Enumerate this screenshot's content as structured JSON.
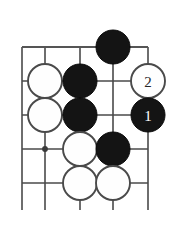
{
  "figure": {
    "name": "go-board-diagram",
    "type": "go-diagram",
    "width": 175,
    "height": 232,
    "background_color": "#ffffff",
    "line_color": "#4a4a4a",
    "black_stone_color": "#141414",
    "white_stone_color": "#fefefe",
    "white_stone_outline_color": "#4a4a4a"
  },
  "board": {
    "stone_radius": 17,
    "columns_x": [
      22,
      45,
      80,
      113,
      148
    ],
    "rows_y": [
      47,
      81,
      115,
      149,
      183
    ],
    "vertical_lines": [
      {
        "x": 22,
        "y1": 47,
        "y2": 210
      },
      {
        "x": 45,
        "y1": 47,
        "y2": 210
      },
      {
        "x": 80,
        "y1": 47,
        "y2": 210
      },
      {
        "x": 113,
        "y1": 47,
        "y2": 210
      },
      {
        "x": 148,
        "y1": 47,
        "y2": 210
      }
    ],
    "horizontal_lines": [
      {
        "y": 47,
        "x1": 22,
        "x2": 148,
        "emphasis": true
      },
      {
        "y": 81,
        "x1": 22,
        "x2": 148,
        "emphasis": false
      },
      {
        "y": 115,
        "x1": 22,
        "x2": 148,
        "emphasis": false
      },
      {
        "y": 149,
        "x1": 22,
        "x2": 148,
        "emphasis": false
      },
      {
        "y": 183,
        "x1": 22,
        "x2": 148,
        "emphasis": false
      }
    ],
    "star_points": [
      {
        "x": 45,
        "y": 149
      }
    ]
  },
  "stones": [
    {
      "id": "stone-black-c4r1",
      "color": "black",
      "x": 113,
      "y": 47,
      "label": ""
    },
    {
      "id": "stone-white-c2r2",
      "color": "white",
      "x": 45,
      "y": 81,
      "label": ""
    },
    {
      "id": "stone-black-c3r2",
      "color": "black",
      "x": 80,
      "y": 81,
      "label": ""
    },
    {
      "id": "stone-white-c5r2",
      "color": "white",
      "x": 148,
      "y": 81,
      "label": "2"
    },
    {
      "id": "stone-white-c2r3",
      "color": "white",
      "x": 45,
      "y": 115,
      "label": ""
    },
    {
      "id": "stone-black-c3r3",
      "color": "black",
      "x": 80,
      "y": 115,
      "label": ""
    },
    {
      "id": "stone-black-c5r3",
      "color": "black",
      "x": 148,
      "y": 115,
      "label": "1"
    },
    {
      "id": "stone-white-c3r4",
      "color": "white",
      "x": 80,
      "y": 149,
      "label": ""
    },
    {
      "id": "stone-black-c4r4",
      "color": "black",
      "x": 113,
      "y": 149,
      "label": ""
    },
    {
      "id": "stone-white-c3r5",
      "color": "white",
      "x": 80,
      "y": 183,
      "label": ""
    },
    {
      "id": "stone-white-c4r5",
      "color": "white",
      "x": 113,
      "y": 183,
      "label": ""
    }
  ],
  "move_labels": {
    "move_1": "1",
    "move_2": "2"
  },
  "caption": {
    "text": ""
  }
}
